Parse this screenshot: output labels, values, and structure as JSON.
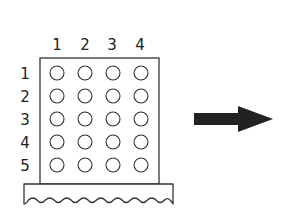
{
  "diagram": {
    "column_labels": [
      "1",
      "2",
      "3",
      "4"
    ],
    "row_labels": [
      "1",
      "2",
      "3",
      "4",
      "5"
    ],
    "grid": {
      "columns": 4,
      "rows": 5,
      "cell_shape": "circle"
    },
    "arrow": {
      "direction": "right",
      "color": "#222222"
    },
    "stroke_color": "#333333"
  }
}
